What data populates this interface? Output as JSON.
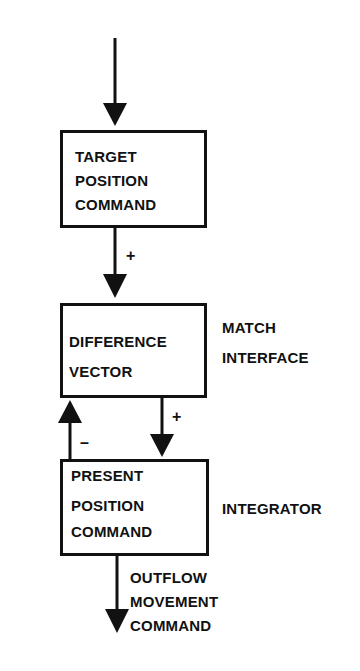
{
  "diagram": {
    "boxes": [
      {
        "id": "target",
        "lines": [
          "TARGET",
          "POSITION",
          "COMMAND"
        ]
      },
      {
        "id": "difference",
        "lines": [
          "DIFFERENCE",
          "VECTOR"
        ],
        "side_label": [
          "MATCH",
          "INTERFACE"
        ]
      },
      {
        "id": "present",
        "lines": [
          "PRESENT",
          "POSITION",
          "COMMAND"
        ],
        "side_label": [
          "INTEGRATOR"
        ]
      }
    ],
    "edge_signs": {
      "target_to_difference": "+",
      "present_to_difference": "–",
      "difference_to_present": "+"
    },
    "output_label": [
      "OUTFLOW",
      "MOVEMENT",
      "COMMAND"
    ],
    "colors": {
      "ink": "#111111",
      "background": "#ffffff"
    }
  }
}
